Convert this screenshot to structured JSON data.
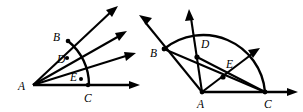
{
  "page": {
    "background_color": "#ffffff",
    "ink_color": "#000000",
    "width": 303,
    "height": 112
  },
  "figures": [
    {
      "id": "left-figure",
      "name": "angle-fan-with-arc",
      "vertex_label": "A",
      "labels": [
        {
          "id": "A",
          "text": "A",
          "x": 18,
          "y": 88
        },
        {
          "id": "B",
          "text": "B",
          "x": 54,
          "y": 42
        },
        {
          "id": "D",
          "text": "D",
          "x": 60,
          "y": 62
        },
        {
          "id": "E",
          "text": "E",
          "x": 73,
          "y": 82
        },
        {
          "id": "C",
          "text": "C",
          "x": 84,
          "y": 102
        }
      ],
      "points": [
        {
          "id": "A",
          "x": 33,
          "y": 85
        },
        {
          "id": "B",
          "x": 68,
          "y": 42
        },
        {
          "id": "D",
          "x": 66,
          "y": 58
        },
        {
          "id": "E",
          "x": 80,
          "y": 79
        },
        {
          "id": "C",
          "x": 88,
          "y": 85
        }
      ],
      "rays": [
        {
          "id": "ray-AB",
          "from": "A",
          "to_x": 118,
          "to_y": 6
        },
        {
          "id": "ray-AD",
          "from": "A",
          "to_x": 126,
          "to_y": 32
        },
        {
          "id": "ray-AE",
          "from": "A",
          "to_x": 134,
          "to_y": 53
        },
        {
          "id": "ray-AC",
          "from": "A",
          "to_x": 138,
          "to_y": 85
        }
      ],
      "arc": {
        "id": "arc-BC",
        "from": "B",
        "to": "C",
        "radius": 56
      }
    },
    {
      "id": "right-figure",
      "name": "semicircle-with-chords",
      "vertex_label": "A",
      "labels": [
        {
          "id": "B",
          "text": "B",
          "x": 152,
          "y": 55
        },
        {
          "id": "D",
          "text": "D",
          "x": 202,
          "y": 46
        },
        {
          "id": "E",
          "text": "E",
          "x": 227,
          "y": 66
        },
        {
          "id": "A",
          "text": "A",
          "x": 198,
          "y": 108
        },
        {
          "id": "C",
          "text": "C",
          "x": 266,
          "y": 108
        }
      ],
      "points": [
        {
          "id": "A",
          "x": 202,
          "y": 92
        },
        {
          "id": "B",
          "x": 165,
          "y": 49
        },
        {
          "id": "D",
          "x": 197,
          "y": 57
        },
        {
          "id": "E",
          "x": 223,
          "y": 77
        },
        {
          "id": "C",
          "x": 265,
          "y": 92
        }
      ],
      "rays": [
        {
          "id": "ray-AB",
          "from": "A",
          "to_x": 139,
          "to_y": 18
        },
        {
          "id": "ray-AD",
          "from": "A",
          "to_x": 190,
          "to_y": 12
        },
        {
          "id": "ray-AE",
          "from": "A",
          "to_x": 258,
          "to_y": 50
        },
        {
          "id": "ray-AC",
          "from": "A",
          "to_x": 296,
          "to_y": 92
        }
      ],
      "chords": [
        {
          "id": "chord-BD-C",
          "from": "B",
          "to": "C"
        },
        {
          "id": "chord-CE-B",
          "from": "C",
          "to": "B"
        }
      ],
      "arc": {
        "id": "arc-BC-semicircle",
        "from": "B",
        "to": "C",
        "radius": 62
      }
    }
  ]
}
